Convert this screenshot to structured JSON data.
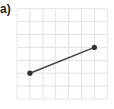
{
  "figure": {
    "label": "a)",
    "grid": {
      "columns": 7,
      "rows": 7,
      "origin_px": [
        17,
        99
      ],
      "cell_px": 12.9,
      "line_color": "#e2e2e2",
      "border_color": "#e6e6e6"
    },
    "segment": {
      "color": "#444444",
      "point_color": "#333333",
      "points": [
        {
          "name": "start",
          "grid_x": 1,
          "grid_y": 2
        },
        {
          "name": "end",
          "grid_x": 6,
          "grid_y": 4
        }
      ]
    }
  }
}
